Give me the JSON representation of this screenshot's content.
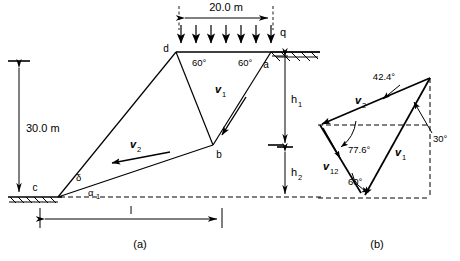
{
  "figure": {
    "panels": [
      {
        "id": "a",
        "caption": "(a)",
        "description": "slope failure wedge geometry"
      },
      {
        "id": "b",
        "caption": "(b)",
        "description": "velocity hodograph"
      }
    ]
  },
  "panel_a": {
    "caption": "(a)",
    "surcharge_label": "q",
    "surcharge_arrow_count": 7,
    "dimensions": {
      "top_width": "20.0 m",
      "slope_height": "30.0 m",
      "base_length": "l",
      "upper_height": "h",
      "upper_height_sub": "1",
      "lower_height": "h",
      "lower_height_sub": "2"
    },
    "points": [
      {
        "name": "d",
        "label": "d"
      },
      {
        "name": "a",
        "label": "a"
      },
      {
        "name": "b",
        "label": "b"
      },
      {
        "name": "c",
        "label": "c"
      }
    ],
    "angles": [
      {
        "name": "angle-d",
        "label": "60°"
      },
      {
        "name": "angle-a",
        "label": "60°"
      },
      {
        "name": "angle-delta",
        "label": "δ"
      },
      {
        "name": "angle-alpha1",
        "label": "α",
        "sub": "1"
      }
    ],
    "velocities": [
      {
        "name": "v1",
        "label": "v",
        "sub": "1"
      },
      {
        "name": "v2",
        "label": "v",
        "sub": "2"
      }
    ]
  },
  "panel_b": {
    "caption": "(b)",
    "angles": [
      {
        "name": "angle-42",
        "label": "42.4°"
      },
      {
        "name": "angle-30",
        "label": "30°"
      },
      {
        "name": "angle-776",
        "label": "77.6°"
      },
      {
        "name": "angle-60",
        "label": "60°"
      }
    ],
    "velocities": [
      {
        "name": "v1",
        "label": "v",
        "sub": "1"
      },
      {
        "name": "v2",
        "label": "v",
        "sub": "2"
      },
      {
        "name": "v12",
        "label": "v",
        "sub": "12"
      }
    ]
  },
  "colors": {
    "ink": "#000000",
    "paper": "#ffffff"
  }
}
